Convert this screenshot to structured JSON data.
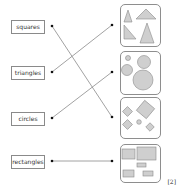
{
  "question": {
    "labels": [
      {
        "id": "squares",
        "text": "squares"
      },
      {
        "id": "triangles",
        "text": "triangles"
      },
      {
        "id": "circles",
        "text": "circles"
      },
      {
        "id": "rectangles",
        "text": "rectangles"
      }
    ],
    "pictures": [
      {
        "id": "triangles-picture",
        "depicts": "triangles"
      },
      {
        "id": "circles-picture",
        "depicts": "circles"
      },
      {
        "id": "squares-picture",
        "depicts": "squares"
      },
      {
        "id": "rectangles-picture",
        "depicts": "rectangles"
      }
    ],
    "matches": [
      {
        "from": "squares",
        "to": "squares-picture"
      },
      {
        "from": "triangles",
        "to": "triangles-picture"
      },
      {
        "from": "circles",
        "to": "circles-picture"
      },
      {
        "from": "rectangles",
        "to": "rectangles-picture"
      }
    ],
    "marks": "[2]"
  },
  "colors": {
    "shape_fill": "#cfcfcf",
    "shape_stroke": "#8a8a8a",
    "line": "#8a8a8a",
    "dot": "#111111"
  }
}
